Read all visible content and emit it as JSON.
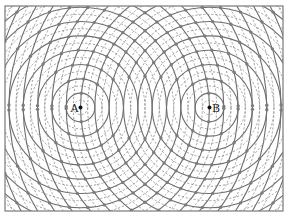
{
  "figure": {
    "frame": {
      "x": 5,
      "y": 6,
      "width": 278,
      "height": 205
    },
    "sources": [
      {
        "label": "A",
        "x": 80.5,
        "y": 107.5
      },
      {
        "label": "B",
        "x": 209.5,
        "y": 107.5
      }
    ],
    "wavelength_px": 14.33,
    "ring_count": 20,
    "colors": {
      "solid": "#6e6e6e",
      "dashed": "#8a8a8a",
      "dot": "#7c7c7c",
      "frame": "#7a7a7a"
    }
  }
}
